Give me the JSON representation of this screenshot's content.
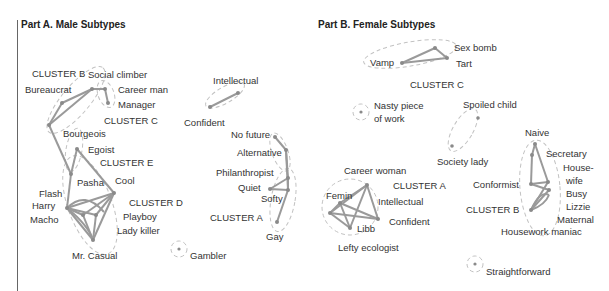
{
  "male": {
    "title": "Part A. Male Subtypes",
    "clusters": {
      "A": "CLUSTER A",
      "B": "CLUSTER B",
      "C": "CLUSTER C",
      "D": "CLUSTER D",
      "E": "CLUSTER E"
    },
    "labels": {
      "social_climber": "Social climber",
      "bureaucrat": "Bureaucrat",
      "career_man": "Career man",
      "manager": "Manager",
      "bourgeois": "Bourgeois",
      "egoist": "Egoist",
      "pasha": "Pasha",
      "cool": "Cool",
      "flash": "Flash",
      "harry": "Harry",
      "macho": "Macho",
      "playboy": "Playboy",
      "lady_killer": "Lady killer",
      "mr_casual": "Mr. Casual",
      "gambler": "Gambler",
      "intellectual": "Intellectual",
      "confident": "Confident",
      "no_future": "No future",
      "alternative": "Alternative",
      "philanthropist": "Philanthropist",
      "quiet": "Quiet",
      "softy": "Softy",
      "gay": "Gay"
    }
  },
  "female": {
    "title": "Part B. Female Subtypes",
    "clusters": {
      "A": "CLUSTER A",
      "B": "CLUSTER B",
      "C": "CLUSTER C"
    },
    "labels": {
      "vamp": "Vamp",
      "sex_bomb": "Sex bomb",
      "tart": "Tart",
      "nasty_piece": "Nasty piece",
      "of_work": "of work",
      "spoiled_child": "Spoiled child",
      "society_lady": "Society lady",
      "career_woman": "Career woman",
      "femin": "Femin",
      "intellectual": "Intellectual",
      "confident": "Confident",
      "libb": "Libb",
      "lefty_ecologist": "Lefty ecologist",
      "naive": "Naive",
      "secretary": "Secretary",
      "house": "House-",
      "wife": "wife",
      "conformist": "Conformist",
      "busy": "Busy",
      "lizzie": "Lizzie",
      "maternal": "Maternal",
      "housework_maniac": "Housework maniac",
      "straightforward": "Straightforward"
    }
  },
  "colors": {
    "edge": "#9a9a9a",
    "node": "#8a8a8a",
    "hull": "#bdbdbd",
    "text": "#333333"
  }
}
